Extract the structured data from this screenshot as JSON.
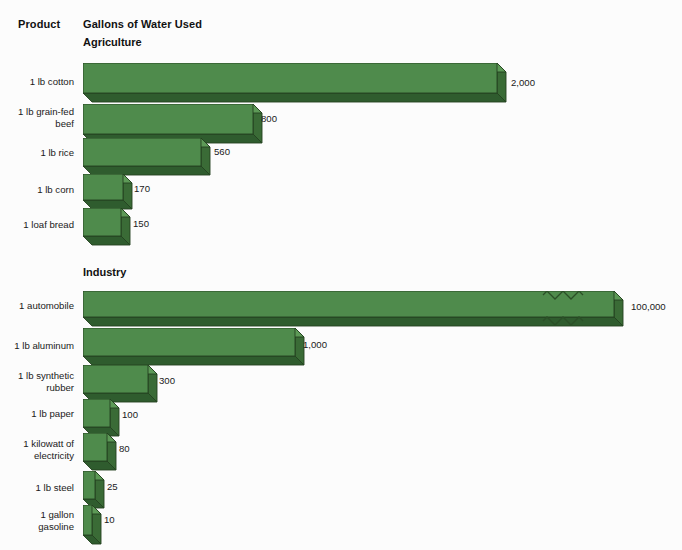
{
  "header": {
    "product_label": "Product",
    "gallons_label": "Gallons of Water Used"
  },
  "sections": [
    {
      "title": "Agriculture"
    },
    {
      "title": "Industry"
    }
  ],
  "chart_data": {
    "type": "bar",
    "orientation": "horizontal",
    "title": "Gallons of Water Used",
    "xlabel": "Gallons of Water Used",
    "ylabel": "Product",
    "grid": false,
    "legend": false,
    "style_note": "3D extruded horizontal bars, dark green shading, scale break on longest bar",
    "colors": {
      "bar_front": "#4f8b4c",
      "bar_top": "#5d9a57",
      "bar_side": "#3a6b36",
      "bar_shadow": "#2f5c2e",
      "bar_outline": "#24421f",
      "background": "#fcfcfc",
      "text": "#1a1a1a"
    },
    "groups": [
      {
        "name": "Agriculture",
        "categories": [
          "1 lb cotton",
          "1 lb grain-fed\nbeef",
          "1 lb rice",
          "1 lb corn",
          "1 loaf bread"
        ],
        "values": [
          2000,
          800,
          560,
          170,
          150
        ],
        "value_labels": [
          "2,000",
          "800",
          "560",
          "170",
          "150"
        ]
      },
      {
        "name": "Industry",
        "categories": [
          "1 automobile",
          "1 lb aluminum",
          "1 lb synthetic\nrubber",
          "1 lb paper",
          "1 kilowatt of\nelectricity",
          "1 lb steel",
          "1 gallon\ngasoline"
        ],
        "values": [
          100000,
          1000,
          300,
          100,
          80,
          25,
          10
        ],
        "value_labels": [
          "100,000",
          "1,000",
          "300",
          "100",
          "80",
          "25",
          "10"
        ],
        "broken_axis_bars": [
          "1 automobile"
        ]
      }
    ]
  },
  "rows": [
    {
      "id": "cotton",
      "group": "Agriculture",
      "label": "1 lb cotton",
      "value": 2000,
      "value_label": "2,000",
      "label_top": 76,
      "bar_top": 63,
      "bar_left": 83,
      "bar_w": 414,
      "bar_h": 30,
      "value_x": 511,
      "value_y": 77,
      "broken": false
    },
    {
      "id": "beef",
      "group": "Agriculture",
      "label": "1 lb grain-fed\nbeef",
      "value": 800,
      "value_label": "800",
      "label_top": 106,
      "bar_top": 104,
      "bar_left": 83,
      "bar_w": 170,
      "bar_h": 30,
      "value_x": 261,
      "value_y": 113,
      "broken": false
    },
    {
      "id": "rice",
      "group": "Agriculture",
      "label": "1 lb rice",
      "value": 560,
      "value_label": "560",
      "label_top": 147,
      "bar_top": 138,
      "bar_left": 83,
      "bar_w": 118,
      "bar_h": 28,
      "value_x": 214,
      "value_y": 146,
      "broken": false
    },
    {
      "id": "corn",
      "group": "Agriculture",
      "label": "1 lb corn",
      "value": 170,
      "value_label": "170",
      "label_top": 184,
      "bar_top": 174,
      "bar_left": 83,
      "bar_w": 40,
      "bar_h": 26,
      "value_x": 134,
      "value_y": 183,
      "broken": false
    },
    {
      "id": "bread",
      "group": "Agriculture",
      "label": "1 loaf bread",
      "value": 150,
      "value_label": "150",
      "label_top": 219,
      "bar_top": 208,
      "bar_left": 83,
      "bar_w": 38,
      "bar_h": 28,
      "value_x": 133,
      "value_y": 218,
      "broken": false
    },
    {
      "id": "automobile",
      "group": "Industry",
      "label": "1 automobile",
      "value": 100000,
      "value_label": "100,000",
      "label_top": 300,
      "bar_top": 291,
      "bar_left": 83,
      "bar_w": 531,
      "bar_h": 26,
      "value_x": 631,
      "value_y": 301,
      "broken": true,
      "zig_x": 543
    },
    {
      "id": "aluminum",
      "group": "Industry",
      "label": "1 lb aluminum",
      "value": 1000,
      "value_label": "1,000",
      "label_top": 340,
      "bar_top": 328,
      "bar_left": 83,
      "bar_w": 212,
      "bar_h": 28,
      "value_x": 303,
      "value_y": 339,
      "broken": false
    },
    {
      "id": "rubber",
      "group": "Industry",
      "label": "1 lb synthetic\nrubber",
      "value": 300,
      "value_label": "300",
      "label_top": 370,
      "bar_top": 365,
      "bar_left": 83,
      "bar_w": 65,
      "bar_h": 28,
      "value_x": 159,
      "value_y": 375,
      "broken": false
    },
    {
      "id": "paper",
      "group": "Industry",
      "label": "1 lb paper",
      "value": 100,
      "value_label": "100",
      "label_top": 408,
      "bar_top": 399,
      "bar_left": 83,
      "bar_w": 27,
      "bar_h": 28,
      "value_x": 122,
      "value_y": 409,
      "broken": false
    },
    {
      "id": "electricity",
      "group": "Industry",
      "label": "1 kilowatt of\nelectricity",
      "value": 80,
      "value_label": "80",
      "label_top": 438,
      "bar_top": 433,
      "bar_left": 83,
      "bar_w": 24,
      "bar_h": 28,
      "value_x": 119,
      "value_y": 443,
      "broken": false
    },
    {
      "id": "steel",
      "group": "Industry",
      "label": "1 lb steel",
      "value": 25,
      "value_label": "25",
      "label_top": 482,
      "bar_top": 471,
      "bar_left": 83,
      "bar_w": 12,
      "bar_h": 28,
      "value_x": 107,
      "value_y": 481,
      "broken": false
    },
    {
      "id": "gasoline",
      "group": "Industry",
      "label": "1 gallon\ngasoline",
      "value": 10,
      "value_label": "10",
      "label_top": 509,
      "bar_top": 505,
      "bar_left": 83,
      "bar_w": 9,
      "bar_h": 30,
      "value_x": 104,
      "value_y": 514,
      "broken": false
    }
  ],
  "section_positions": {
    "agriculture_title_top": 36,
    "industry_title_top": 266
  }
}
